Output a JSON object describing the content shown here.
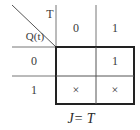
{
  "kmap": {
    "col_variable": "T",
    "row_variable": "Q(t)",
    "col_headers": [
      "0",
      "1"
    ],
    "row_headers": [
      "0",
      "1"
    ],
    "cells": [
      [
        "",
        "1"
      ],
      [
        "×",
        "×"
      ]
    ],
    "caption": "J= T"
  },
  "colors": {
    "line": "#555555",
    "text": "#3a3a3a"
  }
}
